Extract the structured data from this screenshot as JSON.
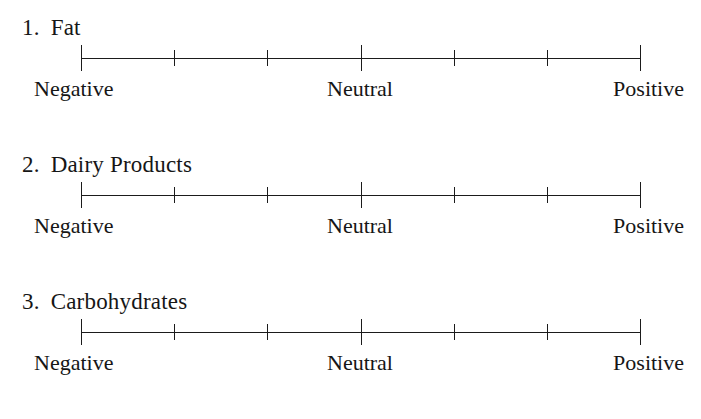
{
  "document": {
    "type": "rating-scale-questionnaire",
    "background_color": "#ffffff",
    "ink_color": "#161616"
  },
  "scale": {
    "tick_count": 7,
    "major_tick_indices": [
      0,
      3,
      6
    ],
    "anchors": {
      "left": "Negative",
      "center": "Neutral",
      "right": "Positive"
    }
  },
  "items": [
    {
      "number": "1.",
      "label": "Fat",
      "anchor_left": "Negative",
      "anchor_center": "Neutral",
      "anchor_right": "Positive"
    },
    {
      "number": "2.",
      "label": "Dairy Products",
      "anchor_left": "Negative",
      "anchor_center": "Neutral",
      "anchor_right": "Positive"
    },
    {
      "number": "3.",
      "label": "Carbohydrates",
      "anchor_left": "Negative",
      "anchor_center": "Neutral",
      "anchor_right": "Positive"
    }
  ]
}
